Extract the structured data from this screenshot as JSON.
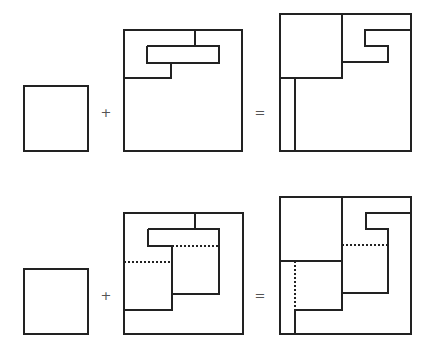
{
  "canvas": {
    "width": 434,
    "height": 355,
    "background": "#ffffff"
  },
  "style": {
    "stroke": "#222222",
    "stroke_width": 1.3,
    "dotted_dash": "1.5,2.5",
    "operator_color": "#555555"
  },
  "rows": [
    {
      "name": "top-equation",
      "operators": [
        {
          "name": "plus-sign",
          "symbol": "+",
          "x": 106,
          "y": 112
        },
        {
          "name": "equals-sign",
          "symbol": "=",
          "x": 260,
          "y": 112
        }
      ],
      "shapes": [
        {
          "name": "small-square",
          "rect": [
            24,
            86,
            88,
            151
          ],
          "solid": [],
          "dotted": []
        },
        {
          "name": "partitioned-square",
          "rect": [
            124,
            30,
            242,
            151
          ],
          "solid": [
            [
              [
                195,
                30
              ],
              [
                195,
                46
              ]
            ],
            [
              [
                147,
                46
              ],
              [
                219,
                46
              ],
              [
                219,
                63
              ],
              [
                147,
                63
              ],
              [
                147,
                46
              ]
            ],
            [
              [
                171,
                63
              ],
              [
                171,
                78
              ],
              [
                124,
                78
              ]
            ]
          ],
          "dotted": []
        },
        {
          "name": "result-square",
          "rect": [
            280,
            14,
            411,
            151
          ],
          "solid": [
            [
              [
                342,
                14
              ],
              [
                342,
                78
              ],
              [
                280,
                78
              ]
            ],
            [
              [
                295,
                78
              ],
              [
                295,
                151
              ]
            ],
            [
              [
                411,
                30
              ],
              [
                365,
                30
              ],
              [
                365,
                46
              ],
              [
                388,
                46
              ],
              [
                388,
                62
              ],
              [
                342,
                62
              ]
            ]
          ],
          "dotted": []
        }
      ]
    },
    {
      "name": "bottom-equation",
      "operators": [
        {
          "name": "plus-sign",
          "symbol": "+",
          "x": 106,
          "y": 295
        },
        {
          "name": "equals-sign",
          "symbol": "=",
          "x": 260,
          "y": 295
        }
      ],
      "shapes": [
        {
          "name": "small-square",
          "rect": [
            24,
            269,
            88,
            334
          ],
          "solid": [],
          "dotted": []
        },
        {
          "name": "partitioned-square",
          "rect": [
            124,
            213,
            243,
            334
          ],
          "solid": [
            [
              [
                195,
                213
              ],
              [
                195,
                229
              ]
            ],
            [
              [
                148,
                229
              ],
              [
                219,
                229
              ],
              [
                219,
                294
              ],
              [
                172,
                294
              ]
            ],
            [
              [
                148,
                229
              ],
              [
                148,
                246
              ],
              [
                172,
                246
              ],
              [
                172,
                310
              ],
              [
                124,
                310
              ]
            ]
          ],
          "dotted": [
            [
              [
                172,
                246
              ],
              [
                219,
                246
              ]
            ],
            [
              [
                124,
                262
              ],
              [
                172,
                262
              ]
            ]
          ]
        },
        {
          "name": "result-square",
          "rect": [
            280,
            197,
            411,
            334
          ],
          "solid": [
            [
              [
                342,
                197
              ],
              [
                342,
                310
              ],
              [
                295,
                310
              ],
              [
                295,
                334
              ]
            ],
            [
              [
                280,
                261
              ],
              [
                342,
                261
              ]
            ],
            [
              [
                411,
                213
              ],
              [
                366,
                213
              ],
              [
                366,
                229
              ],
              [
                388,
                229
              ],
              [
                388,
                293
              ],
              [
                342,
                293
              ]
            ]
          ],
          "dotted": [
            [
              [
                342,
                245
              ],
              [
                388,
                245
              ]
            ],
            [
              [
                295,
                261
              ],
              [
                295,
                310
              ]
            ]
          ]
        }
      ]
    }
  ]
}
